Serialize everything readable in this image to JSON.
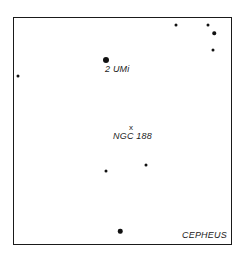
{
  "chart": {
    "constellation_label": "CEPHEUS",
    "object_marker": "x",
    "object_label": "NGC 188",
    "star_label": "2 UMi"
  },
  "stars": [
    {
      "x": 106,
      "y": 60,
      "size": 6
    },
    {
      "x": 176,
      "y": 25,
      "size": 3
    },
    {
      "x": 208,
      "y": 25,
      "size": 3
    },
    {
      "x": 214,
      "y": 33,
      "size": 3.5
    },
    {
      "x": 213,
      "y": 50,
      "size": 3
    },
    {
      "x": 18,
      "y": 76,
      "size": 3
    },
    {
      "x": 106,
      "y": 171,
      "size": 3
    },
    {
      "x": 146,
      "y": 165,
      "size": 3
    },
    {
      "x": 120,
      "y": 231,
      "size": 4.5
    }
  ]
}
